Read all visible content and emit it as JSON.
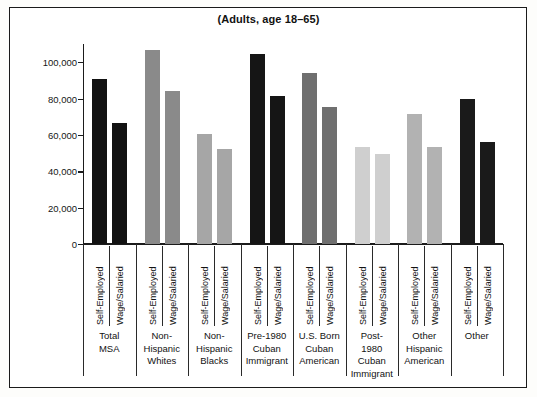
{
  "figure": {
    "title": "(Adults, age 18–65)",
    "background_color": "#ffffff",
    "frame_color": "#1b1b1b"
  },
  "chart_data": {
    "type": "bar",
    "title": "(Adults, age 18–65)",
    "xlabel": "",
    "ylabel": "",
    "ylim": [
      0,
      110000
    ],
    "yticks": [
      0,
      20000,
      40000,
      60000,
      80000,
      100000
    ],
    "ytick_labels": [
      "0",
      "20,000",
      "40,000",
      "60,000",
      "80,000",
      "100,000"
    ],
    "grid": false,
    "legend": "none",
    "series_names": [
      "Self-Employed",
      "Wage/Salaried"
    ],
    "categories": [
      "Total MSA",
      "Non-Hispanic Whites",
      "Non-Hispanic Blacks",
      "Pre-1980 Cuban Immigrant",
      "U.S. Born Cuban American",
      "Post-1980 Cuban Immigrant",
      "Other Hispanic American",
      "Other"
    ],
    "series": [
      {
        "name": "Self-Employed",
        "values": [
          90500,
          106500,
          60500,
          104500,
          94000,
          53500,
          71500,
          79500
        ]
      },
      {
        "name": "Wage/Salaried",
        "values": [
          66500,
          84000,
          52500,
          81500,
          75500,
          49500,
          53500,
          56000
        ]
      }
    ],
    "bars": [
      {
        "group": "Total MSA",
        "series": "Self-Employed",
        "value": 90500,
        "color": "#121212"
      },
      {
        "group": "Total MSA",
        "series": "Wage/Salaried",
        "value": 66500,
        "color": "#121212"
      },
      {
        "group": "Non-Hispanic Whites",
        "series": "Self-Employed",
        "value": 106500,
        "color": "#8a8a8a"
      },
      {
        "group": "Non-Hispanic Whites",
        "series": "Wage/Salaried",
        "value": 84000,
        "color": "#8a8a8a"
      },
      {
        "group": "Non-Hispanic Blacks",
        "series": "Self-Employed",
        "value": 60500,
        "color": "#a6a6a6"
      },
      {
        "group": "Non-Hispanic Blacks",
        "series": "Wage/Salaried",
        "value": 52500,
        "color": "#a6a6a6"
      },
      {
        "group": "Pre-1980 Cuban Immigrant",
        "series": "Self-Employed",
        "value": 104500,
        "color": "#151515"
      },
      {
        "group": "Pre-1980 Cuban Immigrant",
        "series": "Wage/Salaried",
        "value": 81500,
        "color": "#151515"
      },
      {
        "group": "U.S. Born Cuban American",
        "series": "Self-Employed",
        "value": 94000,
        "color": "#6f6f6f"
      },
      {
        "group": "U.S. Born Cuban American",
        "series": "Wage/Salaried",
        "value": 75500,
        "color": "#6f6f6f"
      },
      {
        "group": "Post-1980 Cuban Immigrant",
        "series": "Self-Employed",
        "value": 53500,
        "color": "#cfcfcf"
      },
      {
        "group": "Post-1980 Cuban Immigrant",
        "series": "Wage/Salaried",
        "value": 49500,
        "color": "#cfcfcf"
      },
      {
        "group": "Other Hispanic American",
        "series": "Self-Employed",
        "value": 71500,
        "color": "#b2b2b2"
      },
      {
        "group": "Other Hispanic American",
        "series": "Wage/Salaried",
        "value": 53500,
        "color": "#b2b2b2"
      },
      {
        "group": "Other",
        "series": "Self-Employed",
        "value": 79500,
        "color": "#1a1a1a"
      },
      {
        "group": "Other",
        "series": "Wage/Salaried",
        "value": 56000,
        "color": "#1a1a1a"
      }
    ],
    "group_label_lines": [
      [
        "Total",
        "MSA"
      ],
      [
        "Non-",
        "Hispanic",
        "Whites"
      ],
      [
        "Non-",
        "Hispanic",
        "Blacks"
      ],
      [
        "Pre-1980",
        "Cuban",
        "Immigrant"
      ],
      [
        "U.S. Born",
        "Cuban",
        "American"
      ],
      [
        "Post-",
        "1980",
        "Cuban",
        "Immigrant"
      ],
      [
        "Other",
        "Hispanic",
        "American"
      ],
      [
        "Other"
      ]
    ]
  }
}
